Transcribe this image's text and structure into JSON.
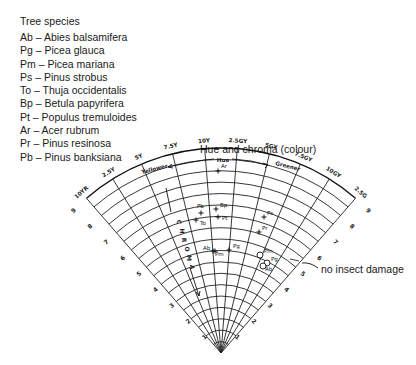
{
  "legend": {
    "title": "Tree species",
    "items": [
      {
        "code": "Ab",
        "name": "Abies balsamifera",
        "label": "Ab – Abies balsamifera"
      },
      {
        "code": "Pg",
        "name": "Picea glauca",
        "label": "Pg – Picea glauca"
      },
      {
        "code": "Pm",
        "name": "Picea mariana",
        "label": "Pm – Picea mariana"
      },
      {
        "code": "Ps",
        "name": "Pinus strobus",
        "label": "Ps – Pinus strobus"
      },
      {
        "code": "To",
        "name": "Thuja occidentalis",
        "label": "To – Thuja occidentalis"
      },
      {
        "code": "Bp",
        "name": "Betula papyrifera",
        "label": "Bp – Betula papyrifera"
      },
      {
        "code": "Pt",
        "name": "Populus tremuloides",
        "label": "Pt – Populus tremuloides"
      },
      {
        "code": "Ar",
        "name": "Acer rubrum",
        "label": "Ar – Acer rubrum"
      },
      {
        "code": "Pr",
        "name": "Pinus resinosa",
        "label": "Pr – Pinus resinosa"
      },
      {
        "code": "Pb",
        "name": "Pinus banksiana",
        "label": "Pb – Pinus banksiana"
      }
    ]
  },
  "chart_data": {
    "type": "scatter",
    "subtype": "polar-fan (Munsell hue/chroma diagram)",
    "title": "Hue and chroma (colour)",
    "hue_axis_label": "Hue",
    "hue_direction_left": "Yellower",
    "hue_direction_right": "Greener",
    "radial_axis_label": "CHROMA",
    "hue_ticks": [
      "10YR",
      "2.5Y",
      "5Y",
      "7.5Y",
      "10Y",
      "2.5GY",
      "5GY",
      "7.5GY",
      "10GY",
      "2.5G"
    ],
    "chroma_ticks": [
      "1",
      "2",
      "3",
      "4",
      "5",
      "6",
      "7",
      "8",
      "9"
    ],
    "geometry": {
      "apex_x": 221,
      "apex_y": 353,
      "radius": 205,
      "angle_start_deg": -41,
      "angle_end_deg": 41,
      "rings": 18
    },
    "annotation": "no insect damage",
    "legend_markers": {
      "plus": "insect damaged",
      "circle": "no insect damage"
    },
    "points": [
      {
        "code": "Ar",
        "marker": "plus",
        "x": 218,
        "y": 171,
        "lx": 221,
        "ly": 168
      },
      {
        "code": "Bp",
        "marker": "plus",
        "x": 216,
        "y": 209,
        "lx": 220,
        "ly": 207
      },
      {
        "code": "Pb",
        "marker": "plus",
        "x": 201,
        "y": 213,
        "lx": 197,
        "ly": 208
      },
      {
        "code": "Pt",
        "marker": "plus",
        "x": 218,
        "y": 217,
        "lx": 222,
        "ly": 220
      },
      {
        "code": "To",
        "marker": "plus",
        "x": 196,
        "y": 220,
        "lx": 200,
        "ly": 225
      },
      {
        "code": "Ps",
        "marker": "plus",
        "x": 264,
        "y": 217,
        "lx": 267,
        "ly": 215
      },
      {
        "code": "Pr",
        "marker": "plus",
        "x": 259,
        "y": 232,
        "lx": 262,
        "ly": 230
      },
      {
        "code": "Ab",
        "marker": "plus",
        "x": 213,
        "y": 251,
        "lx": 203,
        "ly": 250
      },
      {
        "code": "Pm",
        "marker": "plus",
        "x": 215,
        "y": 251,
        "lx": 215,
        "ly": 256
      },
      {
        "code": "Pg",
        "marker": "plus",
        "x": 229,
        "y": 250,
        "lx": 233,
        "ly": 248
      },
      {
        "code": "Pm",
        "marker": "circle",
        "x": 260,
        "y": 255,
        "lx": 264,
        "ly": 253
      },
      {
        "code": "Pg",
        "marker": "circle",
        "x": 267,
        "y": 263,
        "lx": 271,
        "ly": 261
      },
      {
        "code": "Ab",
        "marker": "circle",
        "x": 263,
        "y": 266,
        "lx": 265,
        "ly": 271
      }
    ]
  }
}
